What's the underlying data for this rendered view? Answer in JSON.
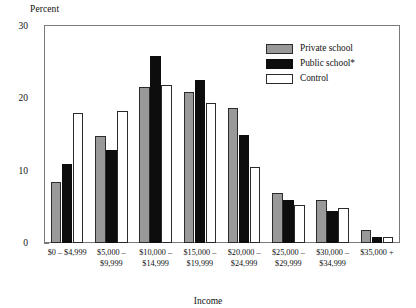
{
  "chart_data": {
    "type": "bar",
    "title": "",
    "xlabel": "Income",
    "ylabel": "Percent",
    "ylim": [
      0,
      30
    ],
    "yticks": [
      0,
      10,
      20,
      30
    ],
    "ytick_labels": [
      "0",
      "10",
      "20",
      "30"
    ],
    "grid": false,
    "legend_position": "top-right",
    "categories": [
      "$0 – $4,999",
      "$5,000 – $9,999",
      "$10,000 – $14,999",
      "$15,000 – $19,999",
      "$20,000 – $24,999",
      "$25,000 – $29,999",
      "$30,000 – $34,999",
      "$35,000 +"
    ],
    "category_lines": [
      [
        "$0 – $4,999",
        ""
      ],
      [
        "$5,000 –",
        "$9,999"
      ],
      [
        "$10,000 –",
        "$14,999"
      ],
      [
        "$15,000 –",
        "$19,999"
      ],
      [
        "$20,000 –",
        "$24,999"
      ],
      [
        "$25,000 –",
        "$29,999"
      ],
      [
        "$30,000 –",
        "$34,999"
      ],
      [
        "$35,000 +",
        ""
      ]
    ],
    "series": [
      {
        "name": "Private school",
        "color": "#999999",
        "values": [
          8.5,
          14.8,
          21.5,
          20.9,
          18.6,
          6.9,
          5.9,
          1.8
        ]
      },
      {
        "name": "Public school*",
        "color": "#0d0d0d",
        "values": [
          10.9,
          12.9,
          25.8,
          22.6,
          15.0,
          5.9,
          4.4,
          0.9
        ]
      },
      {
        "name": "Control",
        "color": "#ffffff",
        "values": [
          18.0,
          18.3,
          21.8,
          19.3,
          10.5,
          5.2,
          4.8,
          0.8
        ]
      }
    ]
  },
  "legend": {
    "items": [
      {
        "label": "Private school",
        "swatch": "private"
      },
      {
        "label": "Public school*",
        "swatch": "public"
      },
      {
        "label": "Control",
        "swatch": "control"
      }
    ]
  }
}
